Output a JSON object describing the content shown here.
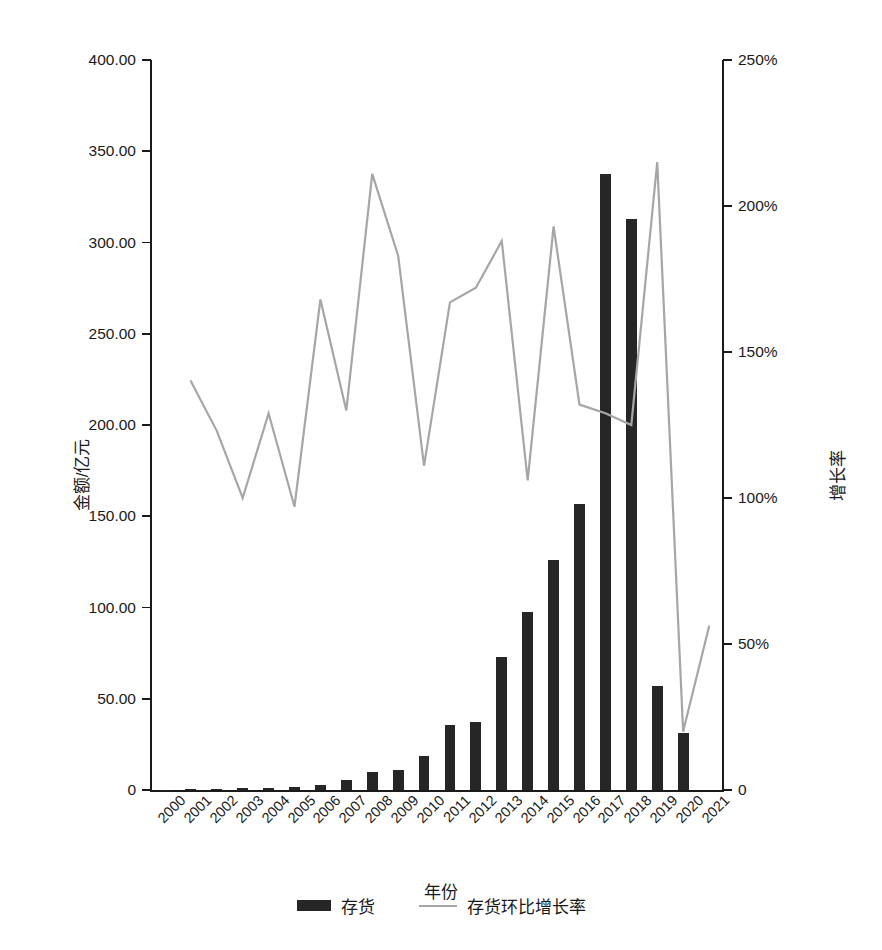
{
  "chart_data": {
    "type": "bar",
    "title": "",
    "xlabel": "年份",
    "ylabel": "金额/亿元",
    "y2label": "增长率",
    "grid": false,
    "legend_position": "bottom",
    "categories": [
      "2000",
      "2001",
      "2002",
      "2003",
      "2004",
      "2005",
      "2006",
      "2007",
      "2008",
      "2009",
      "2010",
      "2011",
      "2012",
      "2013",
      "2014",
      "2015",
      "2016",
      "2017",
      "2018",
      "2019",
      "2020",
      "2021"
    ],
    "ylim": [
      0,
      400
    ],
    "y2lim": [
      0,
      250
    ],
    "yticks": [
      "0",
      "50.00",
      "100.00",
      "150.00",
      "200.00",
      "250.00",
      "300.00",
      "350.00",
      "400.00"
    ],
    "ytick_values": [
      0,
      50,
      100,
      150,
      200,
      250,
      300,
      350,
      400
    ],
    "y2ticks": [
      "0",
      "50%",
      "100%",
      "150%",
      "200%",
      "250%"
    ],
    "y2tick_values": [
      0,
      50,
      100,
      150,
      200,
      250
    ],
    "series": [
      {
        "name": "存货",
        "type": "bar",
        "axis": "left",
        "color": "#262626",
        "values": [
          0.15,
          0.35,
          0.8,
          1.0,
          1.1,
          1.8,
          2.6,
          5.3,
          9.9,
          10.8,
          18.6,
          35.4,
          37.3,
          72.8,
          97.8,
          125.8,
          156.5,
          337.5,
          313.0,
          56.8,
          31.5,
          0
        ]
      },
      {
        "name": "存货环比增长率",
        "type": "line",
        "axis": "right",
        "color": "#a6a6a6",
        "values": [
          null,
          140,
          123,
          100,
          129,
          97,
          168,
          130,
          211,
          183,
          111,
          167,
          172,
          188,
          106,
          193,
          132,
          129,
          125,
          215,
          20,
          56
        ]
      }
    ]
  },
  "legend": {
    "items": [
      {
        "label": "存货",
        "marker": "bar-swatch"
      },
      {
        "label": "存货环比增长率",
        "marker": "line-swatch"
      }
    ]
  }
}
